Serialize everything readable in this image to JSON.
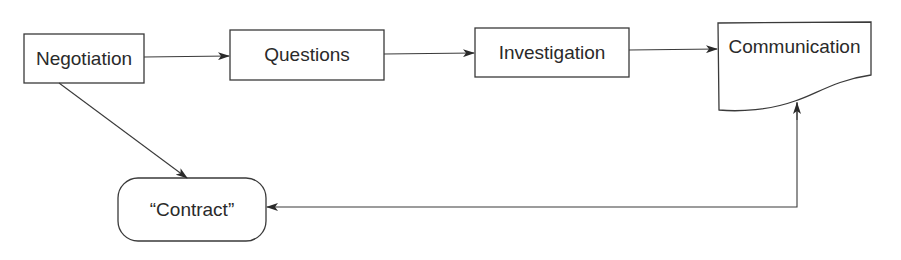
{
  "diagram": {
    "type": "flowchart",
    "colors": {
      "stroke": "#3a3a3a",
      "text": "#2a2a2a",
      "background": "#ffffff"
    },
    "nodes": [
      {
        "id": "negotiation",
        "label": "Negotiation",
        "shape": "rectangle"
      },
      {
        "id": "questions",
        "label": "Questions",
        "shape": "rectangle"
      },
      {
        "id": "investigation",
        "label": "Investigation",
        "shape": "rectangle"
      },
      {
        "id": "communication",
        "label": "Communication",
        "shape": "document"
      },
      {
        "id": "contract",
        "label": "“Contract”",
        "shape": "rounded-rectangle"
      }
    ],
    "edges": [
      {
        "from": "negotiation",
        "to": "questions"
      },
      {
        "from": "questions",
        "to": "investigation"
      },
      {
        "from": "investigation",
        "to": "communication"
      },
      {
        "from": "negotiation",
        "to": "contract"
      },
      {
        "from": "contract",
        "to": "communication",
        "bidirectional_hint": "arrowheads at both ends"
      }
    ]
  }
}
